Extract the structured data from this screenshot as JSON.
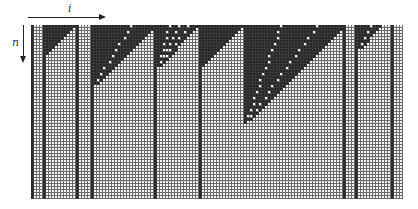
{
  "axes": {
    "horizontal_label": "i",
    "vertical_label": "n"
  },
  "grid": {
    "columns": 124,
    "rows": 58,
    "cell_px": 3,
    "colors": {
      "dark": "#262626",
      "light": "#f4f4f4",
      "line": "#6a6a6a"
    },
    "stripe_columns": [
      0,
      4,
      15,
      20,
      41,
      56,
      104,
      108,
      120
    ],
    "triangles": [
      {
        "left": 4,
        "right": 14,
        "height": 10,
        "white_diagonals": []
      },
      {
        "left": 20,
        "right": 41,
        "height": 21,
        "white_diagonals": [
          8
        ]
      },
      {
        "left": 42,
        "right": 55,
        "height": 14,
        "white_diagonals": [
          3,
          6,
          9
        ]
      },
      {
        "left": 56,
        "right": 70,
        "height": 14,
        "white_diagonals": []
      },
      {
        "left": 71,
        "right": 104,
        "height": 33,
        "white_diagonals": [
          9,
          21
        ]
      },
      {
        "left": 109,
        "right": 116,
        "height": 8,
        "white_diagonals": [
          3
        ]
      }
    ]
  }
}
